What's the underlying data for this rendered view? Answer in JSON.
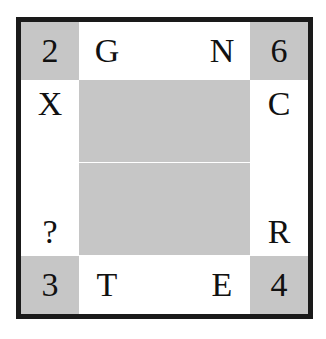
{
  "puzzle": {
    "type": "letter-number-grid",
    "colors": {
      "border": "#1a1a1a",
      "shaded": "#c6c6c6",
      "background": "#ffffff",
      "glyph": "#111111"
    },
    "corners": [
      {
        "position": "top-left",
        "value": "2"
      },
      {
        "position": "top-right",
        "value": "6"
      },
      {
        "position": "bottom-left",
        "value": "3"
      },
      {
        "position": "bottom-right",
        "value": "4"
      }
    ],
    "edges": {
      "top": [
        {
          "value": "G"
        },
        {
          "value": "N"
        }
      ],
      "bottom": [
        {
          "value": "T"
        },
        {
          "value": "E"
        }
      ],
      "left": [
        {
          "value": "X"
        },
        {
          "value": "?"
        }
      ],
      "right": [
        {
          "value": "C"
        },
        {
          "value": "R"
        }
      ]
    },
    "interior": {
      "shaded": true,
      "divider": "horizontal-white-seam"
    }
  }
}
